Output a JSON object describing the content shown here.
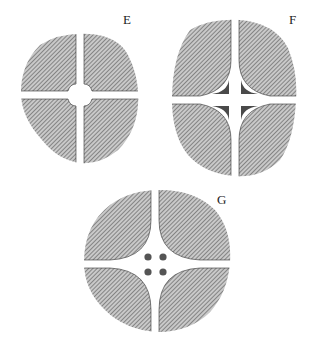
{
  "figure": {
    "panels": [
      {
        "id": "E",
        "label": "E",
        "description": "Circular section divided into four hatched quadrants by a thin cross of gaps with a small circular opening at center"
      },
      {
        "id": "F",
        "label": "F",
        "description": "Oval section with four hatched quadrants having concave curved inner corners; central star-shaped region contains four dark triangular cusps separated by a cross"
      },
      {
        "id": "G",
        "label": "G",
        "description": "Circular section with four hatched quadrants having concave curved inner corners; four small dark dots in the central open space"
      }
    ],
    "colors": {
      "hatch": "#6a6a6a",
      "fill_dark": "#4a4a4a",
      "background": "#ffffff",
      "text": "#222222"
    }
  }
}
